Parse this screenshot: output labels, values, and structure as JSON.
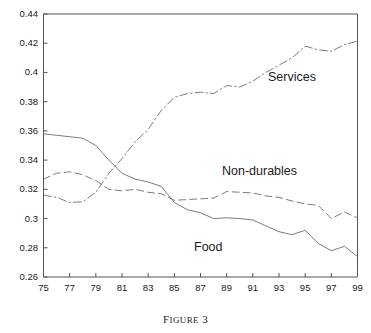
{
  "caption": {
    "prefix": "F",
    "rest": "IGURE",
    "number": "3",
    "full": "Figure 3"
  },
  "axes": {
    "y_ticks": [
      "0.26",
      "0.28",
      "0.3",
      "0.32",
      "0.34",
      "0.36",
      "0.38",
      "0.4",
      "0.42",
      "0.44"
    ],
    "x_ticks": [
      "75",
      "77",
      "79",
      "81",
      "83",
      "85",
      "87",
      "89",
      "91",
      "93",
      "95",
      "97",
      "99"
    ],
    "ylim": [
      0.26,
      0.44
    ],
    "xlim": [
      75,
      99
    ]
  },
  "labels": {
    "services": "Services",
    "nondurables": "Non-durables",
    "food": "Food"
  },
  "colors": {
    "axis": "#555555",
    "line": "#6d6d6d",
    "text": "#1a1a1a"
  },
  "chart_data": {
    "type": "line",
    "title": "",
    "xlabel": "",
    "ylabel": "",
    "xlim": [
      75,
      99
    ],
    "ylim": [
      0.26,
      0.44
    ],
    "grid": false,
    "legend": "inline-annotations",
    "x": [
      75,
      76,
      77,
      78,
      79,
      80,
      81,
      82,
      83,
      84,
      85,
      86,
      87,
      88,
      89,
      90,
      91,
      92,
      93,
      94,
      95,
      96,
      97,
      98,
      99
    ],
    "series": [
      {
        "name": "Food",
        "style": "solid",
        "values": [
          0.358,
          0.357,
          0.356,
          0.355,
          0.35,
          0.34,
          0.331,
          0.327,
          0.325,
          0.322,
          0.311,
          0.306,
          0.304,
          0.3,
          0.3005,
          0.3,
          0.299,
          0.295,
          0.291,
          0.289,
          0.292,
          0.283,
          0.278,
          0.281,
          0.274
        ]
      },
      {
        "name": "Non-durables",
        "style": "dashed",
        "values": [
          0.327,
          0.331,
          0.332,
          0.33,
          0.326,
          0.32,
          0.319,
          0.32,
          0.318,
          0.317,
          0.3125,
          0.313,
          0.3135,
          0.314,
          0.3185,
          0.318,
          0.3175,
          0.3155,
          0.3145,
          0.312,
          0.31,
          0.309,
          0.3,
          0.3045,
          0.3005
        ]
      },
      {
        "name": "Services",
        "style": "dash-dot",
        "values": [
          0.316,
          0.3145,
          0.311,
          0.3115,
          0.318,
          0.331,
          0.341,
          0.3525,
          0.361,
          0.374,
          0.383,
          0.3855,
          0.3865,
          0.3855,
          0.391,
          0.39,
          0.394,
          0.4,
          0.405,
          0.41,
          0.418,
          0.4155,
          0.4145,
          0.419,
          0.4215
        ]
      }
    ]
  }
}
